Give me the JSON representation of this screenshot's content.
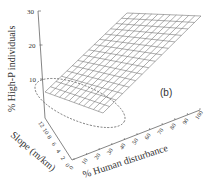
{
  "chart_data": {
    "type": "surface3d",
    "panel_label": "(b)",
    "zlabel": "% High-P individuals",
    "ylabel": "Slope (m/km)",
    "xlabel": "% Human disturbance",
    "z_ticks": [
      "10",
      "20",
      "30"
    ],
    "zlim": [
      0,
      30
    ],
    "y_ticks": [
      "12",
      "10",
      "8",
      "6",
      "4",
      "2",
      "0"
    ],
    "ylim": [
      0,
      12
    ],
    "x_ticks": [
      "0",
      "10",
      "20",
      "30",
      "40",
      "50",
      "60",
      "70",
      "80",
      "90",
      "100"
    ],
    "xlim": [
      0,
      100
    ],
    "surface": {
      "description": "Planar wireframe surface rising with % human disturbance and decreasing slope",
      "corners": [
        {
          "disturbance": 0,
          "slope": 12,
          "z": 5
        },
        {
          "disturbance": 100,
          "slope": 12,
          "z": 30
        },
        {
          "disturbance": 0,
          "slope": 0,
          "z": 0
        },
        {
          "disturbance": 100,
          "slope": 0,
          "z": 28
        }
      ],
      "grid_lines_x": 15,
      "grid_lines_y": 12
    },
    "annotation": "dashed ellipse highlighting low disturbance / high slope region"
  },
  "colors": {
    "axis": "#555555",
    "mesh": "#777777",
    "text": "#333333"
  }
}
